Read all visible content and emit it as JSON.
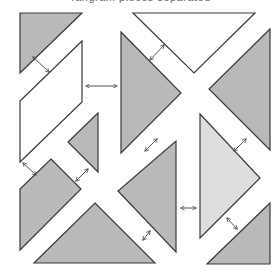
{
  "title": "Tangram pieces separated",
  "colors": {
    "background": "#ffffff",
    "stroke": "#3a3a3a",
    "gray": "#b9b9b9",
    "light": "#dedede",
    "white": "#ffffff",
    "arrow": "#555555"
  },
  "pieces": [
    {
      "id": "top-left-triangle",
      "fill": "gray",
      "points": "20,13 82,13 20,73"
    },
    {
      "id": "left-parallelogram",
      "fill": "white",
      "points": "82,41 82,102 20,162 20,101"
    },
    {
      "id": "small-middle-triangle",
      "fill": "gray",
      "points": "98,113 98,172 68,142"
    },
    {
      "id": "lower-left-square",
      "fill": "gray",
      "points": "51,159 81,189 20,250 20,189"
    },
    {
      "id": "bottom-triangle",
      "fill": "gray",
      "points": "95,203 155,263 34,263"
    },
    {
      "id": "large-left-gray-triangle",
      "fill": "gray",
      "points": "121,32 181,93 121,153"
    },
    {
      "id": "top-white-triangle",
      "fill": "white",
      "points": "133,13 255,13 194,73"
    },
    {
      "id": "right-gray-triangle",
      "fill": "gray",
      "points": "270,29 270,150 209,89"
    },
    {
      "id": "center-gray-triangle",
      "fill": "gray",
      "points": "176,141 176,252 118,191"
    },
    {
      "id": "right-light-triangle",
      "fill": "light",
      "points": "200,114 260,178 200,238"
    },
    {
      "id": "bottom-right-triangle",
      "fill": "gray",
      "points": "270,203 270,264 207,264"
    }
  ],
  "arrows": [
    {
      "id": "arrow-triangle-parallelogram",
      "x1": 33,
      "y1": 57,
      "x2": 49,
      "y2": 72
    },
    {
      "id": "arrow-parallelogram-large-triangle",
      "x1": 86,
      "y1": 86,
      "x2": 117,
      "y2": 86
    },
    {
      "id": "arrow-large-triangle-top-triangle",
      "x1": 150,
      "y1": 60,
      "x2": 164,
      "y2": 45
    },
    {
      "id": "arrow-parallelogram-square",
      "x1": 23,
      "y1": 163,
      "x2": 36,
      "y2": 175
    },
    {
      "id": "arrow-small-triangle-square",
      "x1": 76,
      "y1": 181,
      "x2": 88,
      "y2": 169
    },
    {
      "id": "arrow-large-triangle-center",
      "x1": 145,
      "y1": 151,
      "x2": 157,
      "y2": 139
    },
    {
      "id": "arrow-right-triangle-light",
      "x1": 234,
      "y1": 151,
      "x2": 246,
      "y2": 139
    },
    {
      "id": "arrow-center-light",
      "x1": 181,
      "y1": 208,
      "x2": 196,
      "y2": 208
    },
    {
      "id": "arrow-center-bottom",
      "x1": 143,
      "y1": 240,
      "x2": 150,
      "y2": 231
    },
    {
      "id": "arrow-light-bottom-right",
      "x1": 227,
      "y1": 218,
      "x2": 237,
      "y2": 229
    }
  ]
}
